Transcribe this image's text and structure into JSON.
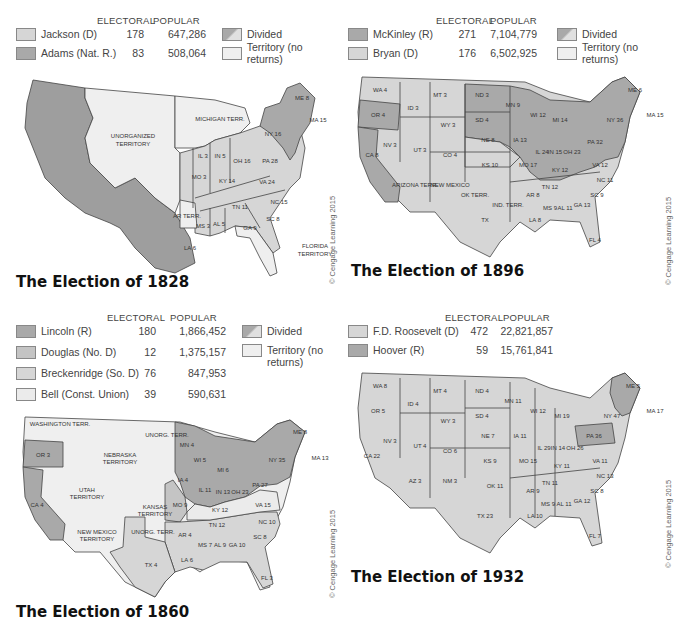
{
  "colors": {
    "dark": "#a9a9a9",
    "mid": "#c4c4c4",
    "light": "#d9d9d9",
    "pale": "#ebebeb",
    "territory": "#efefef",
    "western": "#9e9e9e"
  },
  "panels": [
    {
      "title": "The Election of 1828",
      "credit": "© Cengage Learning 2015",
      "headers": {
        "electoral": "ELECTORAL",
        "popular": "POPULAR"
      },
      "candidates": [
        {
          "name": "Jackson (D)",
          "electoral": "178",
          "popular": "647,286",
          "color": "#d6d6d6"
        },
        {
          "name": "Adams (Nat. R.)",
          "electoral": "83",
          "popular": "508,064",
          "color": "#a9a9a9"
        }
      ],
      "key": [
        {
          "label": "Divided"
        },
        {
          "label": "Territory (no returns)"
        }
      ],
      "map_labels": [
        "UNORGANIZED TERRITORY",
        "MICHIGAN TERR.",
        "AR TERR.",
        "FLORIDA TERRITORY",
        "NH",
        "VT",
        "ME 1 / 8",
        "MA 15",
        "RI 4",
        "CT 8",
        "NJ 8",
        "DE 3",
        "MD 6",
        "NY 16 / 20",
        "PA 28",
        "OH 16",
        "IN 5",
        "IL 3",
        "MO 3",
        "KY 14",
        "VA 24",
        "NC 15",
        "TN 11",
        "SC 8",
        "GA 9",
        "AL 5",
        "MS 3",
        "LA 6"
      ]
    },
    {
      "title": "The Election of 1896",
      "credit": "© Cengage Learning 2015",
      "headers": {
        "electoral": "ELECTORAL",
        "popular": "POPULAR"
      },
      "candidates": [
        {
          "name": "McKinley (R)",
          "electoral": "271",
          "popular": "7,104,779",
          "color": "#a9a9a9"
        },
        {
          "name": "Bryan (D)",
          "electoral": "176",
          "popular": "6,502,925",
          "color": "#d6d6d6"
        }
      ],
      "key": [
        {
          "label": "Divided"
        },
        {
          "label": "Territory (no returns)"
        }
      ],
      "map_labels": [
        "WA 4",
        "OR 4",
        "CA 8 / 1",
        "ID 3",
        "NV 3",
        "MT 3",
        "WY 3",
        "UT 3",
        "CO 4",
        "ARIZONA TERR.",
        "NEW MEXICO TERR.",
        "ND 3",
        "SD 4",
        "NE 8",
        "KS 10",
        "OK TERR.",
        "IND. TERR.",
        "TX",
        "MN 9",
        "IA 13",
        "MO 17",
        "AR 8",
        "LA 8",
        "WI 12",
        "IL 24",
        "MI 14",
        "IN 15",
        "OH 23",
        "KY 12",
        "TN 12",
        "MS 9",
        "AL 11",
        "GA 13",
        "FL 4",
        "SC 9",
        "NC 11",
        "VA 12",
        "WV 6",
        "PA 32",
        "NY 36",
        "ME 6",
        "NH",
        "VT",
        "MA 15",
        "RI 4",
        "CT 6",
        "NJ 10",
        "DE 3",
        "MD 8"
      ]
    },
    {
      "title": "The Election of 1860",
      "credit": "© Cengage Learning 2015",
      "headers": {
        "electoral": "ELECTORAL",
        "popular": "POPULAR"
      },
      "candidates": [
        {
          "name": "Lincoln (R)",
          "electoral": "180",
          "popular": "1,866,452",
          "color": "#a9a9a9"
        },
        {
          "name": "Douglas (No. D)",
          "electoral": "12",
          "popular": "1,375,157",
          "color": "#c4c4c4"
        },
        {
          "name": "Breckenridge (So. D)",
          "electoral": "76",
          "popular": "847,953",
          "color": "#d6d6d6"
        },
        {
          "name": "Bell (Const. Union)",
          "electoral": "39",
          "popular": "590,631",
          "color": "#ebebeb"
        }
      ],
      "key": [
        {
          "label": "Divided"
        },
        {
          "label": "Territory (no returns)"
        }
      ],
      "map_labels": [
        "WASHINGTON TERR.",
        "OR 3",
        "CA 4",
        "NEBRASKA TERRITORY",
        "UTAH TERRITORY",
        "KANSAS TERRITORY",
        "NEW MEXICO TERRITORY",
        "UNORG. TERR.",
        "UNORG. TERR.",
        "TX 4",
        "MN 4",
        "WI 5",
        "IA 4",
        "MO 9",
        "AR 4",
        "LA 6",
        "IL 11",
        "MI 6",
        "IN 13",
        "OH 23",
        "KY 12",
        "TN 12",
        "MS 7",
        "AL 9",
        "GA 10",
        "FL 3",
        "SC 8",
        "NC 10",
        "VA 15",
        "PA 27",
        "NY 35",
        "ME 8",
        "NH",
        "VT",
        "MA 13",
        "RI 4",
        "CT 6",
        "NJ",
        "DE 8",
        "MD 8"
      ]
    },
    {
      "title": "The Election of 1932",
      "credit": "© Cengage Learning 2015",
      "headers": {
        "electoral": "ELECTORAL",
        "popular": "POPULAR"
      },
      "candidates": [
        {
          "name": "F.D. Roosevelt (D)",
          "electoral": "472",
          "popular": "22,821,857",
          "color": "#d6d6d6"
        },
        {
          "name": "Hoover (R)",
          "electoral": "59",
          "popular": "15,761,841",
          "color": "#a9a9a9"
        }
      ],
      "key": [],
      "map_labels": [
        "WA 8",
        "OR 5",
        "CA 22",
        "ID 4",
        "NV 3",
        "MT 4",
        "WY 3",
        "UT 4",
        "CO 6",
        "AZ 3",
        "NM 3",
        "ND 4",
        "SD 4",
        "NE 7",
        "KS 9",
        "OK 11",
        "TX 23",
        "MN 11",
        "IA 11",
        "MO 15",
        "AR 9",
        "LA 10",
        "WI 12",
        "IL 29",
        "MI 19",
        "IN 14",
        "OH 26",
        "KY 11",
        "TN 11",
        "MS 9",
        "AL 11",
        "GA 12",
        "FL 7",
        "SC 8",
        "NC 13",
        "VA 11",
        "WV 8",
        "PA 36",
        "NY 47",
        "ME 5",
        "NH",
        "VT",
        "MA 17",
        "RI 5",
        "CT 7",
        "NJ 16",
        "DE 3",
        "MD 8"
      ]
    }
  ]
}
